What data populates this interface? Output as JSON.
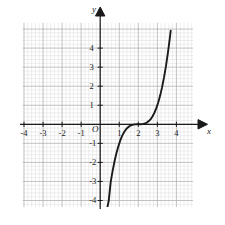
{
  "figure": {
    "kind": "coordinate-graph",
    "background_color": "#ffffff",
    "grid": {
      "minor_color": "#d9d9d9",
      "major_color": "#a8a8a8",
      "minor_step": 0.2,
      "major_step": 1,
      "visible": true,
      "x_extent": [
        -4.7,
        4.7
      ],
      "y_extent": [
        -4.7,
        4.7
      ]
    },
    "axis_color": "#1a1a1a",
    "curve_color": "#1a1a1a"
  },
  "labels": {
    "x_axis": "x",
    "y_axis": "y",
    "origin": "O"
  },
  "ticks": {
    "x_negative": [
      "-4",
      "-3",
      "-2",
      "-1"
    ],
    "x_positive": [
      "1",
      "2",
      "3",
      "4"
    ],
    "y_positive": [
      "1",
      "2",
      "3",
      "4"
    ],
    "y_negative": [
      "-1",
      "-2",
      "-3",
      "-4"
    ]
  },
  "chart_data": {
    "type": "line",
    "title": "",
    "xlabel": "x",
    "ylabel": "y",
    "xlim": [
      -4.7,
      4.7
    ],
    "ylim": [
      -4.7,
      4.7
    ],
    "grid": true,
    "legend": "none",
    "xticks": [
      -4,
      -3,
      -2,
      -1,
      1,
      2,
      3,
      4
    ],
    "yticks": [
      -4,
      -3,
      -2,
      -1,
      1,
      2,
      3,
      4
    ],
    "annotations": [
      "O"
    ],
    "series": [
      {
        "name": "y = (x - 2)^3",
        "equation": "y = (x - 2)^3",
        "inflection_point": [
          2,
          0
        ],
        "x": [
          0.35,
          0.45,
          0.55,
          0.65,
          0.75,
          0.85,
          0.95,
          1.05,
          1.15,
          1.25,
          1.35,
          1.45,
          1.55,
          1.65,
          1.75,
          1.85,
          1.95,
          2.05,
          2.15,
          2.25,
          2.35,
          2.45,
          2.55,
          2.65,
          2.75,
          2.85,
          2.95,
          3.05,
          3.15,
          3.25,
          3.35,
          3.45,
          3.55,
          3.65,
          3.7
        ],
        "y": [
          -4.49,
          -4.0,
          -3.04,
          -2.46,
          -1.95,
          -1.52,
          -1.16,
          -0.86,
          -0.61,
          -0.42,
          -0.27,
          -0.17,
          -0.09,
          -0.04,
          -0.02,
          -0.003,
          -0.0001,
          0.0001,
          0.003,
          0.02,
          0.04,
          0.09,
          0.17,
          0.27,
          0.42,
          0.61,
          0.86,
          1.16,
          1.52,
          1.95,
          2.46,
          3.04,
          3.72,
          4.49,
          4.91
        ]
      }
    ]
  }
}
